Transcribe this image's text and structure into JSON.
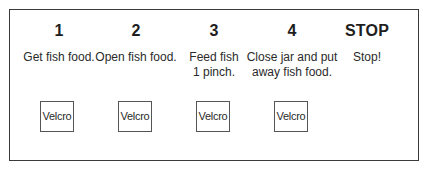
{
  "schedule": {
    "steps": [
      {
        "number": "1",
        "text": "Get fish food.",
        "slot_label": "Velcro"
      },
      {
        "number": "2",
        "text": "Open fish food.",
        "slot_label": "Velcro"
      },
      {
        "number": "3",
        "text": "Feed fish\n1 pinch.",
        "slot_label": "Velcro"
      },
      {
        "number": "4",
        "text": "Close jar and put\naway fish food.",
        "slot_label": "Velcro"
      }
    ],
    "stop": {
      "label": "STOP",
      "text": "Stop!"
    }
  }
}
